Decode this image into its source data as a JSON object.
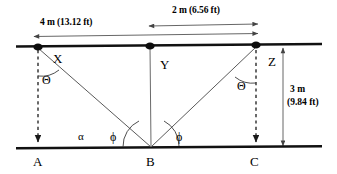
{
  "diagram": {
    "colors": {
      "line": "#111111",
      "ray": "#555555",
      "dashed": "#222222",
      "text": "#000000",
      "background": "#ffffff"
    },
    "dimensions": [
      {
        "id": "dim-4m",
        "label": "4 m (13.12 ft)",
        "value_m": 4,
        "value_ft": 13.12,
        "from": "X",
        "to": "Z",
        "orientation": "horizontal"
      },
      {
        "id": "dim-2m",
        "label": "2 m (6.56 ft)",
        "value_m": 2,
        "value_ft": 6.56,
        "from": "Y",
        "to": "Z",
        "orientation": "horizontal"
      },
      {
        "id": "dim-3m",
        "label_line1": "3 m",
        "label_line2": "(9.84 ft)",
        "value_m": 3,
        "value_ft": 9.84,
        "from": "Z",
        "to": "C",
        "orientation": "vertical"
      }
    ],
    "points": [
      {
        "id": "X",
        "label": "X",
        "on": "upper-line",
        "x": 38,
        "y": 48
      },
      {
        "id": "Y",
        "label": "Y",
        "on": "upper-line",
        "x": 150,
        "y": 48
      },
      {
        "id": "Z",
        "label": "Z",
        "on": "upper-line",
        "x": 256,
        "y": 48
      },
      {
        "id": "A",
        "label": "A",
        "on": "lower-line",
        "x": 38,
        "y": 147
      },
      {
        "id": "B",
        "label": "B",
        "on": "lower-line",
        "x": 151,
        "y": 147
      },
      {
        "id": "C",
        "label": "C",
        "on": "lower-line",
        "x": 256,
        "y": 147
      }
    ],
    "angles": [
      {
        "id": "theta-x",
        "label": "Θ",
        "name": "theta",
        "vertex": "X",
        "between": [
          "X-A",
          "X-B"
        ]
      },
      {
        "id": "theta-z",
        "label": "Θ",
        "name": "theta",
        "vertex": "Z",
        "between": [
          "Z-C",
          "Z-B"
        ]
      },
      {
        "id": "alpha",
        "label": "α",
        "name": "alpha",
        "vertex": "B",
        "between": [
          "B-A",
          "B-X"
        ]
      },
      {
        "id": "phi-left",
        "label": "ϕ",
        "name": "phi",
        "vertex": "B",
        "between": [
          "B-A",
          "B-X"
        ]
      },
      {
        "id": "phi-right",
        "label": "ϕ",
        "name": "phi",
        "vertex": "B",
        "between": [
          "B-C",
          "B-Z"
        ]
      }
    ],
    "rays": [
      {
        "from": "X",
        "to": "B",
        "style": "solid"
      },
      {
        "from": "Z",
        "to": "B",
        "style": "solid"
      },
      {
        "from": "Y",
        "to": "B",
        "style": "solid"
      },
      {
        "from": "X",
        "to": "A",
        "style": "dashed"
      },
      {
        "from": "Z",
        "to": "C",
        "style": "dashed"
      }
    ]
  }
}
